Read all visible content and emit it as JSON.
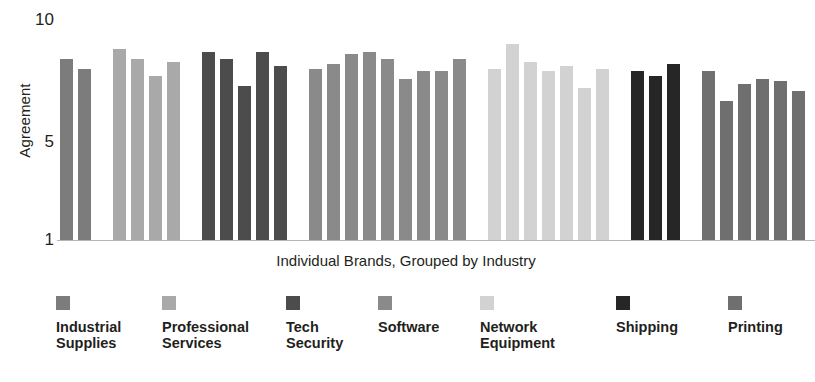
{
  "chart_data": {
    "type": "bar",
    "title": "",
    "subtitle": "",
    "xlabel": "Individual Brands, Grouped by Industry",
    "ylabel": "Agreement",
    "ylim": [
      1,
      10
    ],
    "yticks": [
      1,
      5,
      10
    ],
    "ytick_labels": [
      "1",
      "5",
      "10"
    ],
    "xtick_labels": [],
    "grid": false,
    "legend_position": "bottom",
    "grouped_by": "industry",
    "series": [
      {
        "name": "Industrial Supplies",
        "color": "#7c7c7c",
        "values": [
          8.4,
          8.0
        ]
      },
      {
        "name": "Professional Services",
        "color": "#a9a9a9",
        "values": [
          8.8,
          8.4,
          7.7,
          8.3
        ]
      },
      {
        "name": "Tech Security",
        "color": "#4c4c4c",
        "values": [
          8.7,
          8.4,
          7.3,
          8.7,
          8.1
        ]
      },
      {
        "name": "Software",
        "color": "#8a8a8a",
        "values": [
          8.0,
          8.2,
          8.6,
          8.7,
          8.4,
          7.6,
          7.9,
          7.9,
          8.4
        ]
      },
      {
        "name": "Network Equipment",
        "color": "#d2d2d2",
        "values": [
          8.0,
          9.0,
          8.3,
          7.9,
          8.1,
          7.2,
          8.0
        ]
      },
      {
        "name": "Shipping",
        "color": "#262626",
        "values": [
          7.9,
          7.7,
          8.2
        ]
      },
      {
        "name": "Printing",
        "color": "#6f6f6f",
        "values": [
          7.9,
          6.7,
          7.4,
          7.6,
          7.5,
          7.1
        ]
      }
    ]
  },
  "axis": {
    "y_title": "Agreement",
    "x_title": "Individual Brands, Grouped by Industry",
    "tick_10": "10",
    "tick_5": "5",
    "tick_1": "1"
  },
  "legend": {
    "items": [
      {
        "label": "Industrial\nSupplies",
        "color": "#7c7c7c"
      },
      {
        "label": "Professional\nServices",
        "color": "#a9a9a9"
      },
      {
        "label": "Tech\nSecurity",
        "color": "#4c4c4c"
      },
      {
        "label": "Software",
        "color": "#8a8a8a"
      },
      {
        "label": "Network\nEquipment",
        "color": "#d2d2d2"
      },
      {
        "label": "Shipping",
        "color": "#262626"
      },
      {
        "label": "Printing",
        "color": "#6f6f6f"
      }
    ]
  },
  "layout": {
    "bar_width_px": 13,
    "bar_gap_px": 5,
    "group_gap_px": 17,
    "plot_left_px": 60,
    "plot_top_px": 20,
    "plot_height_px": 220
  }
}
